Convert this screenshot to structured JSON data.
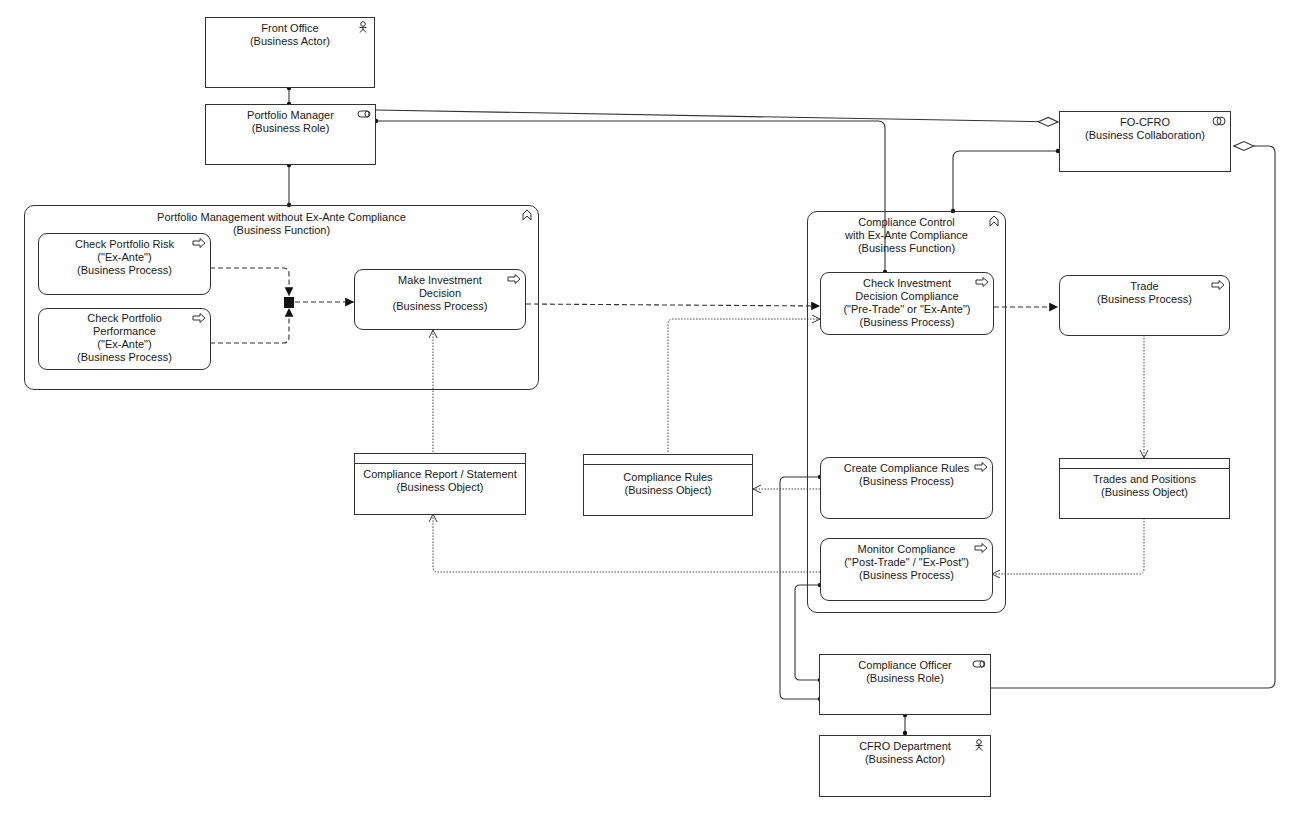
{
  "diagram": {
    "type": "ArchiMate business layer view",
    "nodes": {
      "front_office": {
        "name": "Front Office",
        "type": "(Business Actor)",
        "icon": "actor-icon"
      },
      "portfolio_manager": {
        "name": "Portfolio Manager",
        "type": "(Business Role)",
        "icon": "role-icon"
      },
      "fo_cfro": {
        "name": "FO-CFRO",
        "type": "(Business Collaboration)",
        "icon": "collaboration-icon"
      },
      "pm_function": {
        "name": "Portfolio Management without Ex-Ante Compliance",
        "type": "(Business Function)",
        "icon": "function-icon"
      },
      "check_risk": {
        "name": "Check Portfolio Risk\n(\"Ex-Ante\")",
        "type": "(Business Process)",
        "icon": "process-icon"
      },
      "check_performance": {
        "name": "Check Portfolio\nPerformance\n(\"Ex-Ante\")",
        "type": "(Business Process)",
        "icon": "process-icon"
      },
      "make_decision": {
        "name": "Make Investment\nDecision",
        "type": "(Business Process)",
        "icon": "process-icon"
      },
      "cc_function": {
        "name": "Compliance Control\nwith Ex-Ante Compliance",
        "type": "(Business Function)",
        "icon": "function-icon"
      },
      "check_decision": {
        "name": "Check Investment\nDecision Compliance\n(\"Pre-Trade\" or \"Ex-Ante\")",
        "type": "(Business Process)",
        "icon": "process-icon"
      },
      "trade": {
        "name": "Trade",
        "type": "(Business Process)",
        "icon": "process-icon"
      },
      "compliance_report": {
        "name": "Compliance Report / Statement",
        "type": "(Business Object)"
      },
      "compliance_rules": {
        "name": "Compliance Rules",
        "type": "(Business Object)"
      },
      "create_rules": {
        "name": "Create Compliance Rules",
        "type": "(Business Process)",
        "icon": "process-icon"
      },
      "trades_positions": {
        "name": "Trades and Positions",
        "type": "(Business Object)"
      },
      "monitor_compliance": {
        "name": "Monitor Compliance\n(\"Post-Trade\" / \"Ex-Post\")",
        "type": "(Business Process)",
        "icon": "process-icon"
      },
      "compliance_officer": {
        "name": "Compliance Officer",
        "type": "(Business Role)",
        "icon": "role-icon"
      },
      "cfro_department": {
        "name": "CFRO Department",
        "type": "(Business Actor)",
        "icon": "actor-icon"
      }
    },
    "relations": [
      {
        "from": "Front Office",
        "to": "Portfolio Manager",
        "kind": "assignment"
      },
      {
        "from": "Portfolio Manager",
        "to": "FO-CFRO",
        "kind": "aggregation"
      },
      {
        "from": "Portfolio Manager",
        "to": "Check Investment Decision Compliance",
        "kind": "assignment"
      },
      {
        "from": "Portfolio Manager",
        "to": "Portfolio Management without Ex-Ante Compliance",
        "kind": "assignment"
      },
      {
        "from": "FO-CFRO",
        "to": "Compliance Control with Ex-Ante Compliance",
        "kind": "assignment"
      },
      {
        "from": "Compliance Officer",
        "to": "FO-CFRO",
        "kind": "aggregation"
      },
      {
        "from": "Check Portfolio Risk",
        "to": "AND junction",
        "kind": "triggering"
      },
      {
        "from": "Check Portfolio Performance",
        "to": "AND junction",
        "kind": "triggering"
      },
      {
        "from": "AND junction",
        "to": "Make Investment Decision",
        "kind": "triggering"
      },
      {
        "from": "Make Investment Decision",
        "to": "Check Investment Decision Compliance",
        "kind": "triggering"
      },
      {
        "from": "Check Investment Decision Compliance",
        "to": "Trade",
        "kind": "triggering"
      },
      {
        "from": "Compliance Report / Statement",
        "to": "Make Investment Decision",
        "kind": "access"
      },
      {
        "from": "Compliance Rules",
        "to": "Check Investment Decision Compliance",
        "kind": "access"
      },
      {
        "from": "Create Compliance Rules",
        "to": "Compliance Rules",
        "kind": "access"
      },
      {
        "from": "Trade",
        "to": "Trades and Positions",
        "kind": "access"
      },
      {
        "from": "Trades and Positions",
        "to": "Monitor Compliance",
        "kind": "access"
      },
      {
        "from": "Monitor Compliance",
        "to": "Compliance Report / Statement",
        "kind": "access"
      },
      {
        "from": "Compliance Officer",
        "to": "Create Compliance Rules",
        "kind": "assignment"
      },
      {
        "from": "Compliance Officer",
        "to": "Monitor Compliance",
        "kind": "assignment"
      },
      {
        "from": "CFRO Department",
        "to": "Compliance Officer",
        "kind": "assignment"
      }
    ]
  }
}
